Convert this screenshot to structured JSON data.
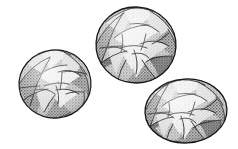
{
  "figure": {
    "kind": "scientific-specimen-illustration",
    "render_style": "stippled halftone line drawing",
    "background_color": "#ffffff",
    "outline_color": "#1a1a1a",
    "caption": "",
    "label": "",
    "specimen_count": 3
  },
  "palette": {
    "background": "#ffffff",
    "outline": "#1a1a1a",
    "stipple_dark": "#6e6e6e",
    "stipple_mid": "#9a9a9a",
    "stipple_light": "#c6c6c6",
    "chamber_pale": "#e3e3e3",
    "chamber_light": "#d2d2d2",
    "chamber_mid": "#b4b4b4",
    "chamber_dark": "#949494",
    "shadow": "#7c7c7c"
  },
  "specimens": [
    {
      "id": "specimen-left",
      "name": "left specimen",
      "position_label": "lower-left",
      "cx": 55,
      "cy": 84,
      "rx": 36,
      "ry": 34,
      "rotation": -6,
      "relative_size": "small",
      "chamber_count": 9
    },
    {
      "id": "specimen-top",
      "name": "top specimen",
      "position_label": "upper-center",
      "cx": 136,
      "cy": 45,
      "rx": 40,
      "ry": 38,
      "rotation": 4,
      "relative_size": "large",
      "chamber_count": 10
    },
    {
      "id": "specimen-right",
      "name": "right specimen",
      "position_label": "lower-right",
      "cx": 186,
      "cy": 111,
      "rx": 41,
      "ry": 32,
      "rotation": -3,
      "relative_size": "medium",
      "chamber_count": 9
    }
  ]
}
